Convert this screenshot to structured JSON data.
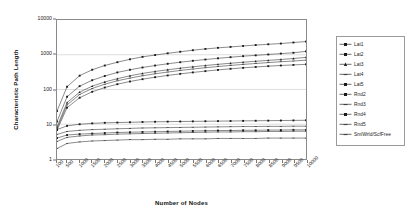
{
  "chart_data": {
    "type": "line",
    "title": "",
    "xlabel": "Number of Nodes",
    "ylabel": "Characteristic Path Length",
    "xscale": "linear",
    "yscale": "log",
    "xlim": [
      100,
      10000
    ],
    "ylim": [
      1,
      10000
    ],
    "grid": "horizontal",
    "legend_position": "right",
    "x": [
      100,
      500,
      1000,
      1500,
      2000,
      2500,
      3000,
      3500,
      4000,
      4500,
      5000,
      5500,
      6000,
      6500,
      7000,
      7500,
      8000,
      8500,
      9000,
      9500,
      10000
    ],
    "xticks": [
      "100",
      "500",
      "1000",
      "1500",
      "2000",
      "2500",
      "3000",
      "3500",
      "4000",
      "4500",
      "5000",
      "5500",
      "6000",
      "6500",
      "7000",
      "7500",
      "8000",
      "8500",
      "9000",
      "9500",
      "10000"
    ],
    "yticks": [
      "1",
      "10",
      "100",
      "1000",
      "10000"
    ],
    "series": [
      {
        "name": "Lat1",
        "marker": "square",
        "values": [
          24,
          120,
          250,
          370,
          490,
          610,
          740,
          870,
          980,
          1100,
          1220,
          1350,
          1470,
          1580,
          1680,
          1790,
          1900,
          2000,
          2100,
          2250,
          2400
        ]
      },
      {
        "name": "Lat2",
        "marker": "square",
        "values": [
          12,
          62,
          125,
          185,
          245,
          310,
          370,
          430,
          490,
          550,
          610,
          670,
          730,
          790,
          850,
          910,
          960,
          1020,
          1080,
          1140,
          1250
        ]
      },
      {
        "name": "Lat3",
        "marker": "triangle",
        "values": [
          8.5,
          42,
          84,
          125,
          165,
          205,
          248,
          290,
          330,
          370,
          410,
          450,
          490,
          530,
          570,
          610,
          650,
          690,
          730,
          780,
          840
        ]
      },
      {
        "name": "Lat4",
        "marker": "dash",
        "values": [
          7.5,
          36,
          72,
          107,
          142,
          178,
          213,
          248,
          283,
          318,
          353,
          388,
          423,
          458,
          493,
          528,
          560,
          595,
          630,
          660,
          700
        ]
      },
      {
        "name": "Lat5",
        "marker": "square",
        "values": [
          6.8,
          30,
          58,
          86,
          114,
          142,
          170,
          198,
          226,
          254,
          282,
          310,
          338,
          366,
          394,
          420,
          445,
          470,
          490,
          510,
          530
        ]
      },
      {
        "name": "Rnd2",
        "marker": "square",
        "values": [
          7.0,
          9.0,
          10.0,
          10.6,
          11.0,
          11.2,
          11.4,
          11.6,
          11.8,
          11.9,
          12.0,
          12.1,
          12.2,
          12.3,
          12.4,
          12.5,
          12.6,
          12.7,
          12.8,
          12.9,
          13.0
        ]
      },
      {
        "name": "Rnd3",
        "marker": "dash",
        "values": [
          5.1,
          6.2,
          6.7,
          7.0,
          7.2,
          7.4,
          7.6,
          7.8,
          7.9,
          8.0,
          8.1,
          8.2,
          8.3,
          8.4,
          8.5,
          8.6,
          8.6,
          8.7,
          8.7,
          8.8,
          8.8
        ]
      },
      {
        "name": "Rnd4",
        "marker": "square",
        "values": [
          4.0,
          4.9,
          5.2,
          5.4,
          5.6,
          5.8,
          5.9,
          6.0,
          6.1,
          6.2,
          6.3,
          6.4,
          6.5,
          6.6,
          6.6,
          6.7,
          6.7,
          6.8,
          6.8,
          6.9,
          6.9
        ]
      },
      {
        "name": "Rnd5",
        "marker": "dash",
        "values": [
          3.2,
          4.2,
          4.6,
          4.9,
          5.0,
          5.2,
          5.3,
          5.4,
          5.5,
          5.6,
          5.7,
          5.8,
          5.9,
          6.0,
          6.0,
          6.1,
          6.1,
          6.2,
          6.2,
          6.3,
          6.3
        ]
      },
      {
        "name": "SmlWrld/ScfFree",
        "marker": "dash",
        "values": [
          2.0,
          2.8,
          3.1,
          3.3,
          3.4,
          3.5,
          3.6,
          3.6,
          3.7,
          3.7,
          3.8,
          3.8,
          3.8,
          3.9,
          3.9,
          3.9,
          3.9,
          4.0,
          4.0,
          4.0,
          4.0
        ]
      }
    ]
  },
  "legend": {
    "items": [
      {
        "label": "Lat1"
      },
      {
        "label": "Lat2"
      },
      {
        "label": "Lat3"
      },
      {
        "label": "Lat4"
      },
      {
        "label": "Lat5"
      },
      {
        "label": "Rnd2"
      },
      {
        "label": "Rnd3"
      },
      {
        "label": "Rnd4"
      },
      {
        "label": "Rnd5"
      },
      {
        "label": "SmlWrld/ScfFree"
      }
    ]
  }
}
